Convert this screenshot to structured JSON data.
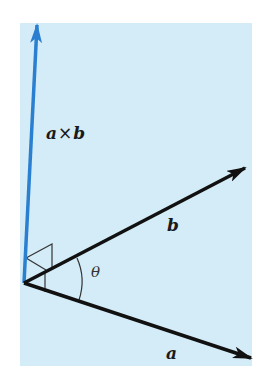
{
  "diagram": {
    "colors": {
      "background": "#ffffff",
      "panel": "#d3ecf7",
      "vector_cross": "#2a7fd0",
      "vector_ab": "#111111",
      "marker": "#333333"
    },
    "panel": {
      "x": 20,
      "y": 23,
      "width": 232,
      "height": 343
    },
    "origin": {
      "x": 24,
      "y": 283
    },
    "vectors": [
      {
        "name": "a",
        "label": "a",
        "tip": {
          "x": 251,
          "y": 358
        },
        "color": "#111111"
      },
      {
        "name": "b",
        "label": "b",
        "tip": {
          "x": 245,
          "y": 168
        },
        "color": "#111111"
      },
      {
        "name": "a_cross_b",
        "label_left": "a",
        "label_op": "×",
        "label_right": "b",
        "tip": {
          "x": 37,
          "y": 23
        },
        "color": "#2a7fd0"
      }
    ],
    "labels": {
      "a": "a",
      "b": "b",
      "cross_left": "a",
      "cross_op": "×",
      "cross_right": "b",
      "angle": "θ"
    }
  }
}
